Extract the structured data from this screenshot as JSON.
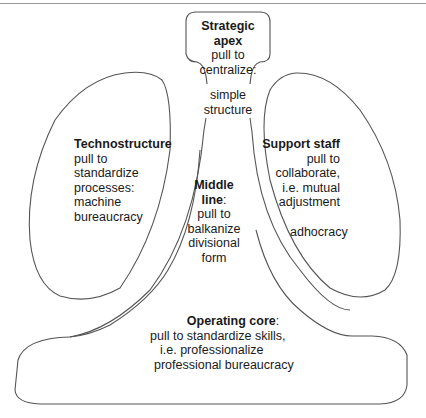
{
  "diagram": {
    "stroke_color": "#555555",
    "strategic_apex": {
      "title": "Strategic",
      "title2": "apex",
      "lines": [
        "pull to",
        "centralize:"
      ],
      "neck_lines": [
        "simple",
        "structure"
      ]
    },
    "technostructure": {
      "title": "Technostructure",
      "lines": [
        "pull to",
        "standardize",
        "processes:",
        "machine",
        "bureaucracy"
      ]
    },
    "support_staff": {
      "title": "Support staff",
      "lines": [
        "pull to",
        "collaborate,",
        "i.e. mutual",
        "adjustment"
      ],
      "config": "adhocracy"
    },
    "middle_line": {
      "title": "Middle",
      "title2": "line",
      "title2_suffix": ":",
      "lines": [
        "pull to",
        "balkanize",
        "divisional",
        "form"
      ]
    },
    "operating_core": {
      "title": "Operating core",
      "title_suffix": ":",
      "lines": [
        "pull to standardize skills,",
        "i.e. professionalize",
        "professional bureaucracy"
      ]
    }
  }
}
